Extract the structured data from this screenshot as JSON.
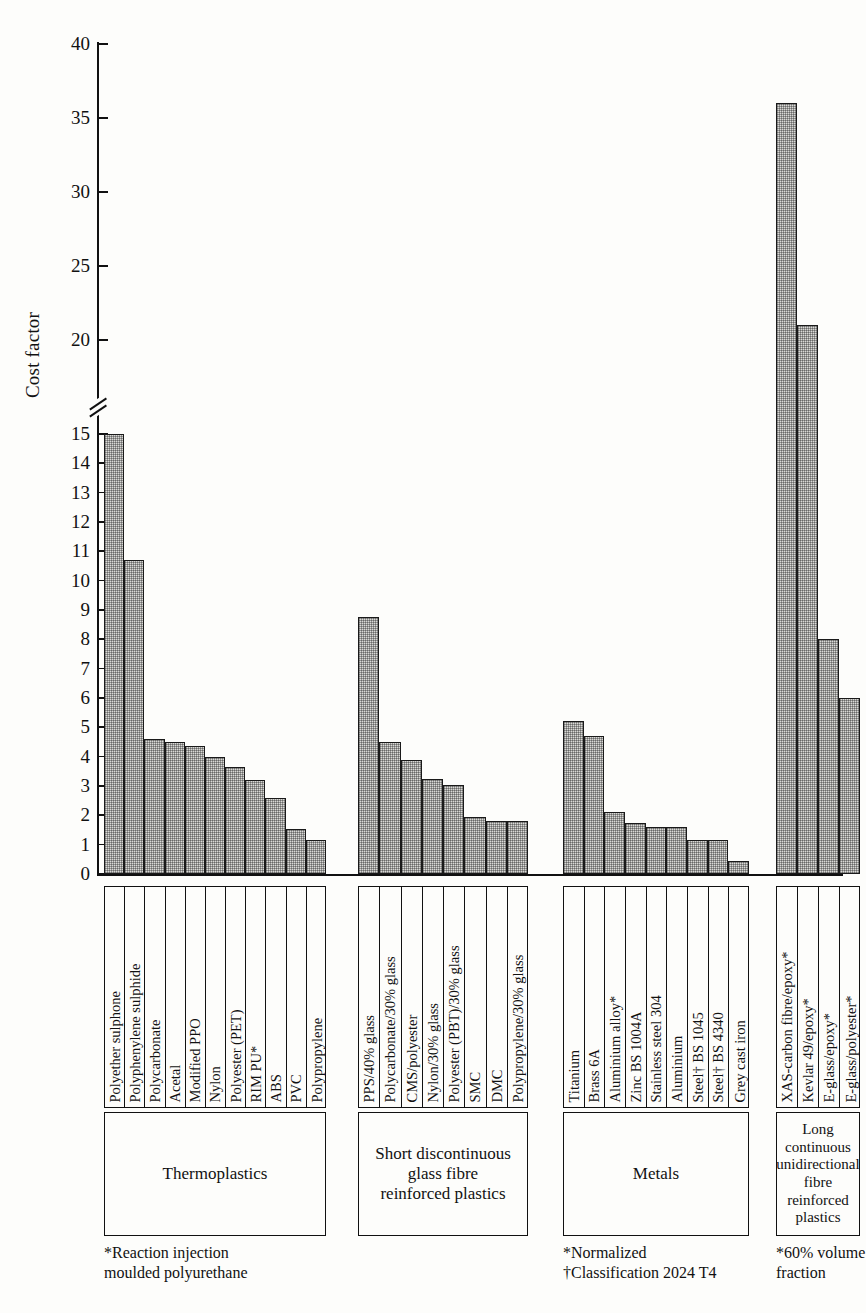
{
  "chart_data": {
    "type": "bar",
    "title": "",
    "xlabel": "",
    "ylabel": "Cost factor",
    "ylim": [
      0,
      40
    ],
    "axis_break": {
      "from": 15,
      "to": 20
    },
    "grid": false,
    "legend": "none",
    "lower_ticks": [
      0,
      1,
      2,
      3,
      4,
      5,
      6,
      7,
      8,
      9,
      10,
      11,
      12,
      13,
      14,
      15
    ],
    "upper_ticks": [
      20,
      25,
      30,
      35,
      40
    ],
    "groups": [
      {
        "name": "Thermoplastics",
        "caption": "Thermoplastics",
        "footnote": "*Reaction injection\nmoulded polyurethane",
        "categories": [
          "Polyether sulphone",
          "Polyphenylene sulphide",
          "Polycarbonate",
          "Acetal",
          "Modified PPO",
          "Nylon",
          "Polyester (PET)",
          "RIM PU*",
          "ABS",
          "PVC",
          "Polypropylene"
        ],
        "values": [
          15.0,
          10.7,
          4.6,
          4.5,
          4.35,
          4.0,
          3.65,
          3.2,
          2.6,
          1.55,
          1.15
        ]
      },
      {
        "name": "Short discontinuous glass fibre reinforced plastics",
        "caption": "Short discontinuous\nglass fibre\nreinforced plastics",
        "footnote": "",
        "categories": [
          "PPS/40% glass",
          "Polycarbonate/30% glass",
          "CMS/polyester",
          "Nylon/30% glass",
          "Polyester (PBT)/30% glass",
          "SMC",
          "DMC",
          "Polypropylene/30% glass"
        ],
        "values": [
          8.75,
          4.5,
          3.9,
          3.25,
          3.05,
          1.95,
          1.8,
          1.8
        ]
      },
      {
        "name": "Metals",
        "caption": "Metals",
        "footnote": "*Normalized\n†Classification 2024 T4",
        "categories": [
          "Titanium",
          "Brass 6A",
          "Aluminium alloy*",
          "Zinc BS 1004A",
          "Stainless steel 304",
          "Aluminium",
          "Steel† BS 1045",
          "Steel† BS 4340",
          "Grey cast iron"
        ],
        "values": [
          5.2,
          4.7,
          2.1,
          1.75,
          1.6,
          1.6,
          1.15,
          1.15,
          0.45
        ]
      },
      {
        "name": "Long continuous unidirectional fibre reinforced plastics",
        "caption": "Long\ncontinuous\nunidirectional\nfibre\nreinforced\nplastics",
        "footnote": "*60% volume\nfraction",
        "categories": [
          "XAS-carbon fibre/epoxy*",
          "Kevlar 49/epoxy*",
          "E-glass/epoxy*",
          "E-glass/polyester*"
        ],
        "values": [
          36.0,
          21.0,
          8.0,
          6.0
        ]
      }
    ]
  },
  "axis": {
    "y_title": "Cost factor"
  }
}
